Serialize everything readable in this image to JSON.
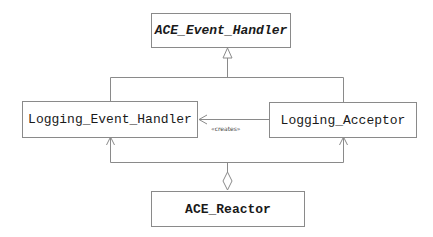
{
  "diagram": {
    "type": "uml-class",
    "classes": [
      {
        "id": "ace_event_handler",
        "label": "ACE_Event_Handler",
        "style": "bold-italic"
      },
      {
        "id": "logging_event_handler",
        "label": "Logging_Event_Handler",
        "style": "normal"
      },
      {
        "id": "logging_acceptor",
        "label": "Logging_Acceptor",
        "style": "normal"
      },
      {
        "id": "ace_reactor",
        "label": "ACE_Reactor",
        "style": "bold"
      }
    ],
    "relations": [
      {
        "type": "generalization",
        "from": "logging_event_handler",
        "to": "ace_event_handler"
      },
      {
        "type": "generalization",
        "from": "logging_acceptor",
        "to": "ace_event_handler"
      },
      {
        "type": "dependency",
        "from": "logging_acceptor",
        "to": "logging_event_handler",
        "label": "«creates»"
      },
      {
        "type": "aggregation",
        "whole": "ace_reactor",
        "parts": [
          "logging_event_handler",
          "logging_acceptor"
        ]
      }
    ],
    "colors": {
      "line": "#8a8a8a",
      "text": "#1a1a1a",
      "background": "#ffffff"
    }
  }
}
